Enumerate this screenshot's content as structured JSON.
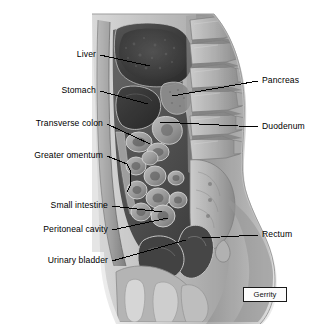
{
  "figure": {
    "signature": "Gerrity",
    "background_color": "#ffffff",
    "label_color": "#000000",
    "leader_line_color": "#000000"
  },
  "labels_left": [
    {
      "id": "liver",
      "text": "Liver",
      "x": 98,
      "y": 56,
      "leader_to_x": 150,
      "leader_to_y": 66
    },
    {
      "id": "stomach",
      "text": "Stomach",
      "x": 98,
      "y": 92,
      "leader_to_x": 148,
      "leader_to_y": 104
    },
    {
      "id": "transverse-colon",
      "text": "Transverse colon",
      "x": 105,
      "y": 125,
      "leader_to_x": 150,
      "leader_to_y": 144
    },
    {
      "id": "greater-omentum",
      "text": "Greater omentum",
      "x": 105,
      "y": 157,
      "leader_to_x": 128,
      "leader_to_y": 172
    },
    {
      "id": "small-intestine",
      "text": "Small intestine",
      "x": 110,
      "y": 207,
      "leader_to_x": 160,
      "leader_to_y": 212
    },
    {
      "id": "peritoneal-cavity",
      "text": "Peritoneal cavity",
      "x": 110,
      "y": 231,
      "leader_to_x": 166,
      "leader_to_y": 219
    },
    {
      "id": "urinary-bladder",
      "text": "Urinary bladder",
      "x": 110,
      "y": 262,
      "leader_to_x": 185,
      "leader_to_y": 240
    }
  ],
  "labels_right": [
    {
      "id": "pancreas",
      "text": "Pancreas",
      "x": 262,
      "y": 82,
      "leader_to_x": 172,
      "leader_to_y": 95
    },
    {
      "id": "duodenum",
      "text": "Duodenum",
      "x": 262,
      "y": 128,
      "leader_to_x": 160,
      "leader_to_y": 122
    },
    {
      "id": "rectum",
      "text": "Rectum",
      "x": 262,
      "y": 236,
      "leader_to_x": 205,
      "leader_to_y": 238
    }
  ],
  "anatomy_structures": [
    "Liver",
    "Stomach",
    "Transverse colon",
    "Greater omentum",
    "Small intestine",
    "Peritoneal cavity",
    "Urinary bladder",
    "Pancreas",
    "Duodenum",
    "Rectum",
    "Lumbar vertebrae",
    "Sacrum",
    "Pubic symphysis",
    "Abdominal wall"
  ]
}
